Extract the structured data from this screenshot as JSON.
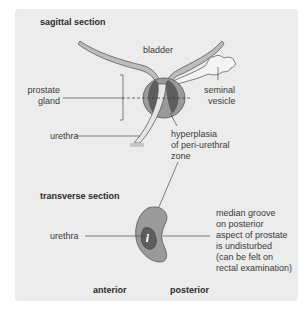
{
  "diagram": {
    "sagittal": {
      "title": "sagittal section",
      "labels": {
        "bladder": "bladder",
        "prostate_line1": "prostate",
        "prostate_line2": "gland",
        "seminal_line1": "seminal",
        "seminal_line2": "vesicle",
        "urethra": "urethra",
        "hyperplasia_line1": "hyperplasia",
        "hyperplasia_line2": "of peri-urethral",
        "hyperplasia_line3": "zone"
      }
    },
    "transverse": {
      "title": "transverse section",
      "labels": {
        "urethra": "urethra",
        "groove_line1": "median groove",
        "groove_line2": "on posterior",
        "groove_line3": "aspect of prostate",
        "groove_line4": "is undisturbed",
        "groove_line5": "(can be felt on",
        "groove_line6": "rectal examination)",
        "anterior": "anterior",
        "posterior": "posterior"
      }
    },
    "colors": {
      "panel_bg": "#ececec",
      "gland_outer": "#9a9a9a",
      "gland_inner": "#5e5e5e",
      "wall_fill": "#bdbdbd",
      "line": "#4a4a4a"
    }
  },
  "caption": ""
}
